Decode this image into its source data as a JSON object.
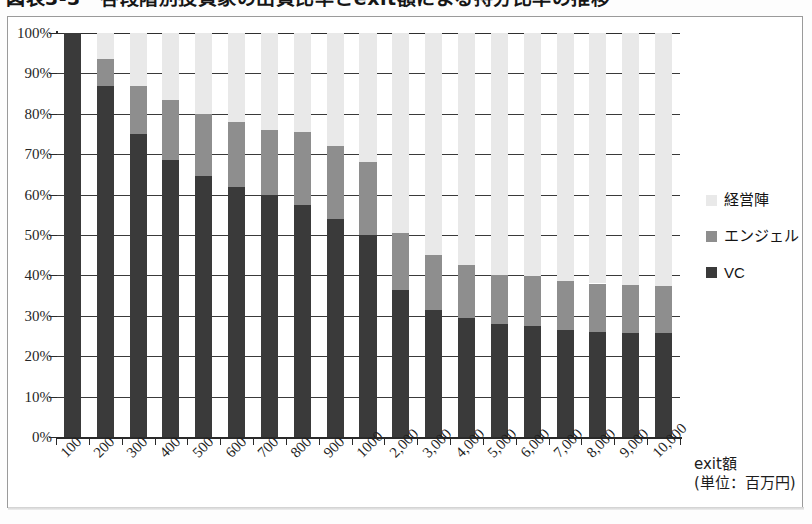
{
  "figure": {
    "title_cropped": "図表3-3　各段階別投資家の出資比率とexit額による持分比率の推移"
  },
  "axis_title": {
    "line1": "exit額",
    "line2": "(単位：百万円)"
  },
  "legend": {
    "items": [
      {
        "key": "mgmt",
        "label": "経営陣",
        "color": "#e9e9e9"
      },
      {
        "key": "angel",
        "label": "エンジェル",
        "color": "#8e8e8e"
      },
      {
        "key": "vc",
        "label": "VC",
        "color": "#3a3a3a"
      }
    ]
  },
  "chart_data": {
    "type": "bar",
    "stacked": true,
    "stacked_100": true,
    "title": "図表3-3　各段階別投資家の出資比率とexit額による持分比率の推移",
    "xlabel": "exit額 (単位：百万円)",
    "ylabel": "",
    "ylim": [
      0,
      100
    ],
    "yticks": [
      "0%",
      "10%",
      "20%",
      "30%",
      "40%",
      "50%",
      "60%",
      "70%",
      "80%",
      "90%",
      "100%"
    ],
    "ytick_values": [
      0,
      10,
      20,
      30,
      40,
      50,
      60,
      70,
      80,
      90,
      100
    ],
    "grid": true,
    "legend_position": "right",
    "categories": [
      "100",
      "200",
      "300",
      "400",
      "500",
      "600",
      "700",
      "800",
      "900",
      "1000",
      "2,000",
      "3,000",
      "4,000",
      "5,000",
      "6,000",
      "7,000",
      "8,000",
      "9,000",
      "10,000"
    ],
    "series": [
      {
        "name": "VC",
        "color": "#3a3a3a",
        "values": [
          100,
          87,
          75,
          68.5,
          64.5,
          62,
          60,
          57.5,
          54,
          50,
          36.5,
          31.5,
          29.5,
          28,
          27.5,
          26.5,
          26,
          25.8,
          25.8
        ]
      },
      {
        "name": "エンジェル",
        "color": "#8e8e8e",
        "values": [
          0,
          6.5,
          12,
          15,
          15.5,
          16,
          16,
          18,
          18,
          18,
          14,
          13.5,
          13,
          12,
          12.3,
          12.2,
          12,
          11.8,
          11.7
        ]
      },
      {
        "name": "経営陣",
        "color": "#e9e9e9",
        "values": [
          0,
          6.5,
          13,
          16.5,
          20,
          22,
          24,
          24.5,
          28,
          32,
          49.5,
          55,
          57.5,
          60,
          60.2,
          61.3,
          62,
          62.4,
          62.5
        ]
      }
    ],
    "cumulative_tops": {
      "vc": [
        100,
        87,
        75,
        68.5,
        64.5,
        62,
        60,
        57.5,
        54,
        50,
        36.5,
        31.5,
        29.5,
        28,
        27.5,
        26.5,
        26,
        25.8,
        25.8
      ],
      "angel": [
        100,
        93.5,
        87,
        83.5,
        80,
        78,
        76,
        75.5,
        72,
        68,
        50.5,
        45,
        42.5,
        40,
        39.8,
        38.7,
        38,
        37.6,
        37.5
      ],
      "mgmt": [
        100,
        100,
        100,
        100,
        100,
        100,
        100,
        100,
        100,
        100,
        100,
        100,
        100,
        100,
        100,
        100,
        100,
        100,
        100
      ]
    }
  }
}
